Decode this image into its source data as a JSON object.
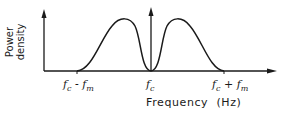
{
  "diagram": {
    "title": "",
    "x_axis": {
      "label": "Frequency  (Hz)"
    },
    "y_axis": {
      "label_line1": "Power",
      "label_line2": "density"
    },
    "ticks": [
      {
        "base": "f",
        "sub": "c",
        "op": " - ",
        "base2": "f",
        "sub2": "m"
      },
      {
        "base": "f",
        "sub": "c"
      },
      {
        "base": "f",
        "sub": "c",
        "op": " + ",
        "base2": "f",
        "sub2": "m"
      }
    ],
    "curve": "Two symmetric lobes around the carrier fc, zero at fc, extending from fc - fm to fc + fm",
    "line_color": "#1a1a1a"
  }
}
